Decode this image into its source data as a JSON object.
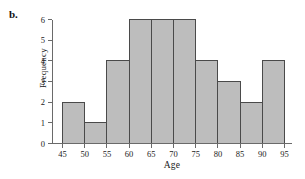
{
  "panel": {
    "label": "b."
  },
  "chart_data": {
    "type": "bar",
    "title": "",
    "subtitle": "",
    "xlabel": "Age",
    "ylabel": "Frequency",
    "categories": [
      "45-50",
      "50-55",
      "55-60",
      "60-65",
      "65-70",
      "70-75",
      "75-80",
      "80-85",
      "85-90",
      "90-95"
    ],
    "bin_edges": [
      45,
      50,
      55,
      60,
      65,
      70,
      75,
      80,
      85,
      90,
      95
    ],
    "values": [
      2,
      1,
      4,
      6,
      6,
      6,
      4,
      3,
      2,
      4
    ],
    "bin_width": 5,
    "xlim": [
      45,
      95
    ],
    "ylim": [
      0,
      6
    ],
    "x_ticks": [
      45,
      50,
      55,
      60,
      65,
      70,
      75,
      80,
      85,
      90,
      95
    ],
    "x_tick_labels": [
      "45",
      "50",
      "55",
      "60",
      "65",
      "70",
      "75",
      "80",
      "85",
      "90",
      "95"
    ],
    "y_ticks": [
      0,
      1,
      2,
      3,
      4,
      5,
      6
    ],
    "y_tick_labels": [
      "0",
      "1",
      "2",
      "3",
      "4",
      "5",
      "6"
    ],
    "grid": false,
    "legend": false,
    "legend_position": "none",
    "bar_fill_color": "#bdbdbd",
    "bar_edge_color": "#4a4a4a",
    "axis_color": "#6a6a6a",
    "background_color": "#ffffff",
    "total_frequency": 38,
    "annotations": []
  }
}
